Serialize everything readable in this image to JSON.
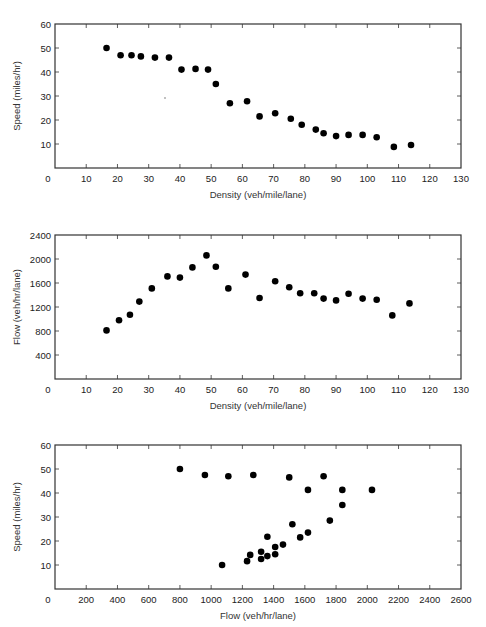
{
  "chart_data": [
    {
      "type": "scatter",
      "title": "",
      "xlabel": "Density (veh/mile/lane)",
      "ylabel": "Speed (miles/hr)",
      "xlim": [
        0,
        130
      ],
      "ylim": [
        0,
        60
      ],
      "xticks": [
        0,
        10,
        20,
        30,
        40,
        50,
        60,
        70,
        80,
        90,
        100,
        110,
        120,
        130
      ],
      "yticks": [
        10,
        20,
        30,
        40,
        50,
        60
      ],
      "grid": false,
      "legend": null,
      "x": [
        16.5,
        21,
        24.5,
        27.5,
        32,
        36.5,
        40.5,
        45,
        49,
        51.5,
        56,
        61.5,
        65.5,
        70.5,
        75.5,
        79,
        83.5,
        86,
        90,
        94,
        98.5,
        103,
        108.5,
        114
      ],
      "y": [
        50,
        47,
        47,
        46.5,
        46,
        46,
        41,
        41.3,
        41,
        35,
        27,
        27.8,
        21.5,
        22.8,
        20.5,
        18,
        16,
        14.5,
        13.3,
        13.8,
        13.8,
        12.8,
        8.8,
        9.6
      ],
      "plot_box": {
        "left": 55,
        "top": 24,
        "right": 461,
        "bottom": 168
      }
    },
    {
      "type": "scatter",
      "title": "",
      "xlabel": "Density (veh/mile/lane)",
      "ylabel": "Flow (veh/hr/lane)",
      "xlim": [
        0,
        130
      ],
      "ylim": [
        0,
        2400
      ],
      "xticks": [
        0,
        10,
        20,
        30,
        40,
        50,
        60,
        70,
        80,
        90,
        100,
        110,
        120,
        130
      ],
      "yticks": [
        400,
        800,
        1200,
        1600,
        2000,
        2400
      ],
      "grid": false,
      "legend": null,
      "x": [
        16.5,
        20.5,
        24,
        27,
        31,
        36,
        40,
        44,
        48.5,
        51.5,
        55.5,
        61,
        65.5,
        70.5,
        75,
        78.5,
        83,
        86,
        90,
        94,
        98.5,
        103,
        108,
        113.5
      ],
      "y": [
        810,
        980,
        1070,
        1290,
        1510,
        1710,
        1690,
        1860,
        2060,
        1870,
        1510,
        1740,
        1350,
        1630,
        1530,
        1430,
        1430,
        1340,
        1310,
        1420,
        1340,
        1320,
        1060,
        1260
      ],
      "plot_box": {
        "left": 55,
        "top": 235,
        "right": 461,
        "bottom": 379
      }
    },
    {
      "type": "scatter",
      "title": "",
      "xlabel": "Flow (veh/hr/lane)",
      "ylabel": "Speed (miles/hr)",
      "xlim": [
        0,
        2600
      ],
      "ylim": [
        0,
        60
      ],
      "xticks": [
        0,
        200,
        400,
        600,
        800,
        1000,
        1200,
        1400,
        1600,
        1800,
        2000,
        2200,
        2400,
        2600
      ],
      "yticks": [
        10,
        20,
        30,
        40,
        50,
        60
      ],
      "grid": false,
      "legend": null,
      "x": [
        800,
        960,
        1110,
        1270,
        1500,
        1720,
        1620,
        1840,
        2030,
        1840,
        1760,
        1520,
        1360,
        1570,
        1620,
        1460,
        1410,
        1320,
        1250,
        1410,
        1360,
        1320,
        1230,
        1070
      ],
      "y": [
        50,
        47.5,
        47,
        47.5,
        46.5,
        47,
        41.3,
        41.3,
        41.3,
        35,
        28.5,
        27,
        21.8,
        21.5,
        23.5,
        18.5,
        17.5,
        15.5,
        14.2,
        14.5,
        13.7,
        12.5,
        11.6,
        10
      ],
      "plot_box": {
        "left": 55,
        "top": 445,
        "right": 461,
        "bottom": 589
      }
    }
  ],
  "labels": {
    "chart1_xlabel": "Density (veh/mile/lane)",
    "chart1_ylabel": "Speed (miles/hr)",
    "chart2_xlabel": "Density (veh/mile/lane)",
    "chart2_ylabel": "Flow (veh/hr/lane)",
    "chart3_xlabel": "Flow (veh/hr/lane)",
    "chart3_ylabel": "Speed (miles/hr)"
  },
  "colors": {
    "marker": "#000000",
    "axis": "#333333"
  }
}
